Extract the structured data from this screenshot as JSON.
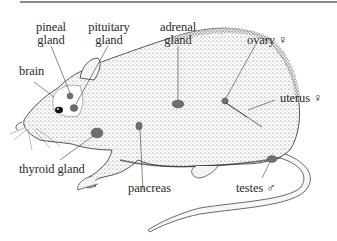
{
  "diagram": {
    "labels": {
      "pineal": [
        "pineal",
        "gland"
      ],
      "pituitary": [
        "pituitary",
        "gland"
      ],
      "adrenal": [
        "adrenal",
        "gland"
      ],
      "ovary": "ovary ♀",
      "brain": "brain",
      "uterus": "uterus ♀",
      "thyroid": "thyroid gland",
      "pancreas": "pancreas",
      "testes": "testes ♂"
    },
    "colors": {
      "gland_fill": "#6e6e6e",
      "outline": "#2b2b2b",
      "stipple": "#555555",
      "leader": "#3a3a3a",
      "frame_line": "#8a8a8a"
    }
  }
}
